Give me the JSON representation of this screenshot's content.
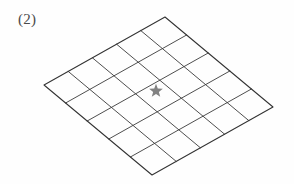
{
  "figure": {
    "label": "(2)",
    "caption_number": 2,
    "marker_icon": "star-icon",
    "background_color": "#fefefe",
    "line_color": "#3a3a3a",
    "star_color": "#828282"
  },
  "chart_data": {
    "type": "diagram",
    "title": "(2)",
    "grid": {
      "rows": 5,
      "cols": 5,
      "cell_count": 25
    },
    "projection": {
      "top_vertex": [
        165,
        17
      ],
      "left_vertex": [
        44,
        85
      ],
      "right_vertex": [
        273,
        107
      ],
      "bottom_vertex": [
        152,
        175
      ]
    },
    "markers": [
      {
        "symbol": "star",
        "row": 3,
        "col": 3,
        "center": [
          156,
          91
        ],
        "color": "#828282"
      }
    ],
    "xlabel": "",
    "ylabel": "",
    "grid_on": true,
    "legend": "none"
  }
}
